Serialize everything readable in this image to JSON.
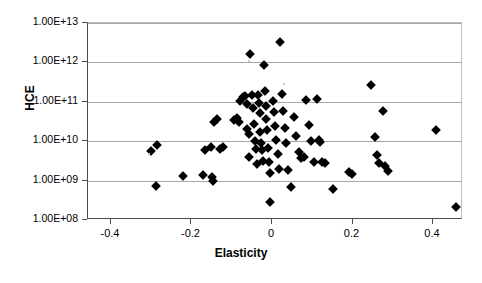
{
  "chart_data": {
    "type": "scatter",
    "title": "",
    "xlabel": "Elasticity",
    "ylabel": "HCE",
    "xlim": [
      -0.4571,
      0.4745
    ],
    "ylim": [
      100000000.0,
      10000000000000.0
    ],
    "yscale": "log",
    "xscale": "linear",
    "grid": true,
    "legend": null,
    "x_ticks": [
      "-0.4",
      "-0.2",
      "0",
      "0.2",
      "0.4"
    ],
    "x_tick_values": [
      -0.4,
      -0.2,
      0,
      0.2,
      0.4
    ],
    "y_ticks": [
      "1.00E+08",
      "1.00E+09",
      "1.00E+10",
      "1.00E+11",
      "1.00E+12",
      "1.00E+13"
    ],
    "y_tick_values": [
      100000000,
      1000000000,
      10000000000,
      100000000000,
      1000000000000,
      10000000000000
    ],
    "marker": "diamond",
    "marker_color": "#000000",
    "points": [
      {
        "x": -0.301,
        "y": 5500000000.0
      },
      {
        "x": -0.285,
        "y": 7800000000.0
      },
      {
        "x": -0.289,
        "y": 730000000.0
      },
      {
        "x": -0.222,
        "y": 1300000000.0
      },
      {
        "x": -0.167,
        "y": 5900000000.0
      },
      {
        "x": -0.171,
        "y": 1400000000.0
      },
      {
        "x": -0.152,
        "y": 7200000000.0
      },
      {
        "x": -0.149,
        "y": 1200000000.0
      },
      {
        "x": -0.146,
        "y": 1000000000.0
      },
      {
        "x": -0.143,
        "y": 30000000000.0
      },
      {
        "x": -0.136,
        "y": 36000000000.0
      },
      {
        "x": -0.129,
        "y": 6500000000.0
      },
      {
        "x": -0.121,
        "y": 7000000000.0
      },
      {
        "x": -0.094,
        "y": 34000000000.0
      },
      {
        "x": -0.087,
        "y": 38000000000.0
      },
      {
        "x": -0.081,
        "y": 31000000000.0
      },
      {
        "x": -0.079,
        "y": 105000000000.0
      },
      {
        "x": -0.071,
        "y": 135000000000.0
      },
      {
        "x": -0.066,
        "y": 140000000000.0
      },
      {
        "x": -0.063,
        "y": 90000000000.0
      },
      {
        "x": -0.061,
        "y": 20000000000.0
      },
      {
        "x": -0.058,
        "y": 15000000000.0
      },
      {
        "x": -0.056,
        "y": 4000000000.0
      },
      {
        "x": -0.054,
        "y": 1600000000000.0
      },
      {
        "x": -0.049,
        "y": 150000000000.0
      },
      {
        "x": -0.046,
        "y": 70000000000.0
      },
      {
        "x": -0.044,
        "y": 28000000000.0
      },
      {
        "x": -0.042,
        "y": 10000000000.0
      },
      {
        "x": -0.04,
        "y": 6500000000.0
      },
      {
        "x": -0.038,
        "y": 2700000000.0
      },
      {
        "x": -0.035,
        "y": 145000000000.0
      },
      {
        "x": -0.033,
        "y": 95000000000.0
      },
      {
        "x": -0.031,
        "y": 52000000000.0
      },
      {
        "x": -0.029,
        "y": 17000000000.0
      },
      {
        "x": -0.027,
        "y": 9000000000.0
      },
      {
        "x": -0.025,
        "y": 6000000000.0
      },
      {
        "x": -0.022,
        "y": 3200000000.0
      },
      {
        "x": -0.02,
        "y": 850000000000.0
      },
      {
        "x": -0.018,
        "y": 190000000000.0
      },
      {
        "x": -0.016,
        "y": 80000000000.0
      },
      {
        "x": -0.014,
        "y": 36000000000.0
      },
      {
        "x": -0.012,
        "y": 19000000000.0
      },
      {
        "x": -0.01,
        "y": 6800000000.0
      },
      {
        "x": -0.008,
        "y": 3000000000.0
      },
      {
        "x": -0.006,
        "y": 1600000000.0
      },
      {
        "x": -0.004,
        "y": 280000000.0
      },
      {
        "x": 0.002,
        "y": 105000000000.0
      },
      {
        "x": 0.005,
        "y": 55000000000.0
      },
      {
        "x": 0.008,
        "y": 24000000000.0
      },
      {
        "x": 0.011,
        "y": 11000000000.0
      },
      {
        "x": 0.014,
        "y": 4800000000.0
      },
      {
        "x": 0.018,
        "y": 2000000000.0
      },
      {
        "x": 0.021,
        "y": 3300000000000.0
      },
      {
        "x": 0.024,
        "y": 160000000000.0
      },
      {
        "x": 0.028,
        "y": 60000000000.0
      },
      {
        "x": 0.032,
        "y": 22000000000.0
      },
      {
        "x": 0.036,
        "y": 9000000000.0
      },
      {
        "x": 0.04,
        "y": 1900000000.0
      },
      {
        "x": 0.046,
        "y": 700000000.0
      },
      {
        "x": 0.055,
        "y": 42000000000.0
      },
      {
        "x": 0.06,
        "y": 13500000000.0
      },
      {
        "x": 0.066,
        "y": 5200000000.0
      },
      {
        "x": 0.072,
        "y": 3800000000.0
      },
      {
        "x": 0.079,
        "y": 4000000000.0
      },
      {
        "x": 0.085,
        "y": 110000000000.0
      },
      {
        "x": 0.092,
        "y": 26000000000.0
      },
      {
        "x": 0.098,
        "y": 10000000000.0
      },
      {
        "x": 0.104,
        "y": 3000000000.0
      },
      {
        "x": 0.112,
        "y": 120000000000.0
      },
      {
        "x": 0.116,
        "y": 11000000000.0
      },
      {
        "x": 0.12,
        "y": 9500000000.0
      },
      {
        "x": 0.124,
        "y": 3000000000.0
      },
      {
        "x": 0.131,
        "y": 2800000000.0
      },
      {
        "x": 0.152,
        "y": 600000000.0
      },
      {
        "x": 0.192,
        "y": 1700000000.0
      },
      {
        "x": 0.199,
        "y": 1500000000.0
      },
      {
        "x": 0.246,
        "y": 260000000000.0
      },
      {
        "x": 0.256,
        "y": 13000000000.0
      },
      {
        "x": 0.262,
        "y": 4500000000.0
      },
      {
        "x": 0.266,
        "y": 2800000000.0
      },
      {
        "x": 0.277,
        "y": 60000000000.0
      },
      {
        "x": 0.281,
        "y": 2400000000.0
      },
      {
        "x": 0.288,
        "y": 1800000000.0
      },
      {
        "x": 0.408,
        "y": 19000000000.0
      },
      {
        "x": 0.456,
        "y": 210000000.0
      }
    ],
    "n_points": 86
  },
  "axes": {
    "y_title": "HCE",
    "x_title": "Elasticity"
  },
  "style": {
    "plot_background": "#ffffff",
    "gridline_color": "#a6a6a6",
    "axis_color": "#4d4d4d",
    "marker_color": "#000000"
  }
}
